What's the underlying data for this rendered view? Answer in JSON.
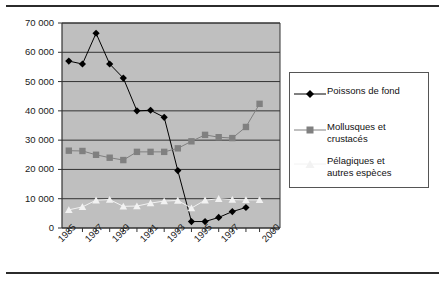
{
  "chart_data": {
    "type": "line",
    "title": "",
    "subtitle": "",
    "xlabel": "",
    "ylabel": "",
    "grid": true,
    "legend_position": "right",
    "plot_background": "#bfbfbf",
    "ylim": [
      0,
      70000
    ],
    "yticks": [
      0,
      10000,
      20000,
      30000,
      40000,
      50000,
      60000,
      70000
    ],
    "ytick_labels": [
      "0",
      "10 000",
      "20 000",
      "30 000",
      "40 000",
      "50 000",
      "60 000",
      "70 000"
    ],
    "x": [
      1985,
      1986,
      1987,
      1988,
      1989,
      1990,
      1991,
      1992,
      1993,
      1994,
      1995,
      1996,
      1997,
      1998,
      1999,
      2000
    ],
    "xtick_labels": [
      "1985",
      "1987",
      "1989",
      "1991",
      "1993",
      "1995",
      "1997",
      "2000"
    ],
    "xtick_indices": [
      0,
      2,
      4,
      6,
      8,
      10,
      12,
      15
    ],
    "series": [
      {
        "name": "Poissons de fond",
        "marker": "diamond",
        "color": "#000000",
        "values": [
          57000,
          56000,
          66500,
          56000,
          51200,
          40000,
          40200,
          37800,
          19600,
          2200,
          2200,
          3600,
          5600,
          7000,
          null,
          null
        ]
      },
      {
        "name": "Mollusques et crustacés",
        "marker": "square",
        "color": "#808080",
        "values": [
          26400,
          26300,
          25000,
          24000,
          23200,
          26000,
          26000,
          26000,
          27200,
          29600,
          31800,
          31000,
          30700,
          34500,
          42400,
          null
        ]
      },
      {
        "name": "Pélagiques et autres espèces",
        "marker": "triangle",
        "color": "#f2f2f2",
        "values": [
          6200,
          7200,
          9500,
          9700,
          7400,
          7500,
          8500,
          9200,
          9400,
          6800,
          9500,
          10000,
          9700,
          9600,
          9600,
          null
        ]
      }
    ]
  },
  "legend": {
    "items": [
      {
        "label": "Poissons de fond",
        "marker": "diamond-marker"
      },
      {
        "label": "Mollusques et\ncrustacés",
        "marker": "square-marker"
      },
      {
        "label": "Pélagiques et\nautres espèces",
        "marker": "triangle-marker"
      }
    ]
  },
  "colors": {
    "series_1": "#000000",
    "series_2": "#808080",
    "series_3": "#f2f2f2",
    "plot_bg": "#bfbfbf",
    "gridline": "#333333",
    "rule": "#2b2b2b"
  }
}
